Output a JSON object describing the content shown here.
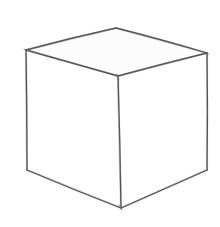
{
  "image": {
    "subject": "pencil sketch of a cube",
    "background": "#ffffff",
    "stroke_color": "#555555",
    "stroke_light": "#8a8a8a"
  },
  "cube": {
    "vertices": {
      "top_back": [
        116,
        28
      ],
      "top_left": [
        26,
        50
      ],
      "top_right": [
        207,
        53
      ],
      "top_front": [
        118,
        76
      ],
      "bottom_left": [
        27,
        170
      ],
      "bottom_front": [
        121,
        208
      ],
      "bottom_right": [
        207,
        170
      ]
    },
    "faces": [
      "top",
      "left",
      "right"
    ]
  }
}
